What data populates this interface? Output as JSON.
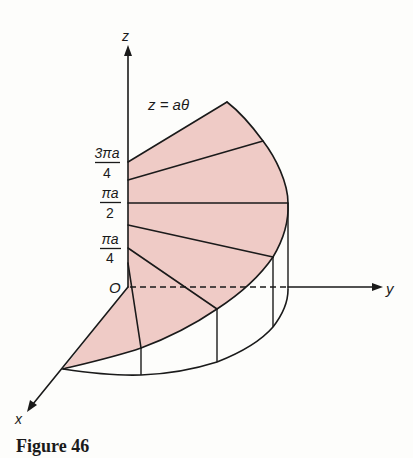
{
  "figure": {
    "caption": "Figure 46",
    "equation_label": "z = aθ"
  },
  "axes": {
    "z_label": "z",
    "y_label": "y",
    "x_label": "x",
    "origin_label": "O"
  },
  "z_ticks": [
    {
      "numerator": "3πa",
      "denominator": "4"
    },
    {
      "numerator": "πa",
      "denominator": "2"
    },
    {
      "numerator": "πa",
      "denominator": "4"
    }
  ],
  "colors": {
    "surface_fill": "#efcbc6",
    "line": "#1a1a1a",
    "background": "#fdfdfb"
  }
}
